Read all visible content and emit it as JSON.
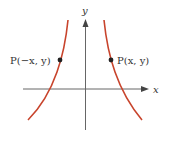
{
  "diagram": {
    "type": "function graph (even function, symmetric about y-axis)",
    "axes": {
      "x_label": "x",
      "y_label": "y"
    },
    "points": [
      {
        "label": "P(−x, y)",
        "side": "left"
      },
      {
        "label": "P(x, y)",
        "side": "right"
      }
    ],
    "colors": {
      "curve": "#c8442c",
      "axis": "#555555",
      "point": "#222222",
      "text": "#333333"
    }
  }
}
